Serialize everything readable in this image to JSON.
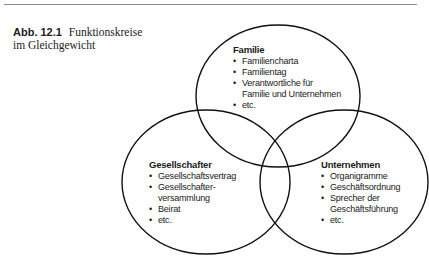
{
  "caption": {
    "number": "Abb. 12.1",
    "text": "Funktionskreise im Gleichgewicht"
  },
  "diagram": {
    "type": "venn",
    "circles": [
      {
        "title": "Familie",
        "items": [
          "Familiencharta",
          "Familientag",
          "Verantwortliche für",
          "Familie und Unternehmen",
          "etc."
        ]
      },
      {
        "title": "Gesellschafter",
        "items": [
          "Gesellschaftsvertrag",
          "Gesellschafter-",
          "versammlung",
          "Beirat",
          "etc."
        ]
      },
      {
        "title": "Unternehmen",
        "items": [
          "Organigramme",
          "Geschäftsordnung",
          "Sprecher der",
          "Geschäftsführung",
          "etc."
        ]
      }
    ]
  }
}
